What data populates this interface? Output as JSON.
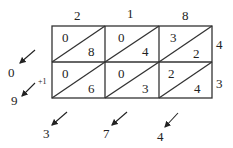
{
  "multiplicand_digits": [
    "2",
    "1",
    "8"
  ],
  "multiplier_digits": [
    "4",
    "3"
  ],
  "cells": [
    [
      {
        "tens": "0",
        "ones": "8"
      },
      {
        "tens": "0",
        "ones": "4"
      },
      {
        "tens": "3",
        "ones": "2"
      }
    ],
    [
      {
        "tens": "0",
        "ones": "6"
      },
      {
        "tens": "0",
        "ones": "3"
      },
      {
        "tens": "2",
        "ones": "4"
      }
    ]
  ],
  "left_results": [
    "0",
    "9"
  ],
  "carry_label": "+1",
  "bottom_results": [
    "3",
    "7",
    "4"
  ]
}
